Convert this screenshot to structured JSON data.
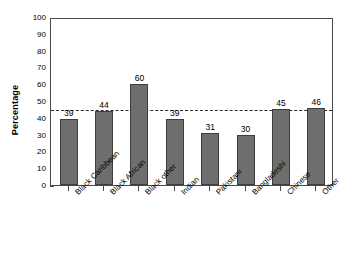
{
  "chart_data": {
    "type": "bar",
    "title": "",
    "subtitle": "",
    "xlabel": "",
    "ylabel": "Percentage",
    "ylim": [
      0,
      100
    ],
    "ytick_labels": [
      "0",
      "10",
      "20",
      "30",
      "40",
      "50",
      "60",
      "70",
      "80",
      "90",
      "100"
    ],
    "ytick_values": [
      0,
      10,
      20,
      30,
      40,
      50,
      60,
      70,
      80,
      90,
      100
    ],
    "grid": false,
    "legend": false,
    "legend_position": "none",
    "categories": [
      "Black Caribbean",
      "Black African",
      "Black other",
      "Indian",
      "Pakistani",
      "Bangladeshi",
      "Chinese",
      "Other"
    ],
    "values": [
      39,
      44,
      60,
      39,
      31,
      30,
      45,
      46
    ],
    "data_labels": [
      "39",
      "44",
      "60",
      "39",
      "31",
      "30",
      "45",
      "46"
    ],
    "annotations": [
      {
        "name": "reference-line",
        "style": "dashed",
        "orientation": "horizontal",
        "value": 46,
        "label": ""
      }
    ],
    "colors": {
      "bar_fill": "#6e6e6e",
      "bar_border": "#3d3d3d",
      "axis": "#4a4a4a",
      "reference_line": "#2b2b2b",
      "text": "#000000",
      "background": "#ffffff"
    }
  }
}
